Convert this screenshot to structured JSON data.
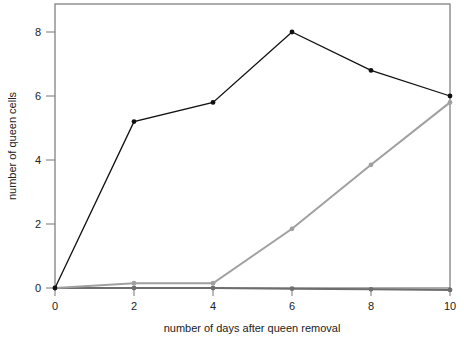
{
  "chart_data": {
    "type": "line",
    "title": "",
    "xlabel": "number  of days after queen removal",
    "ylabel": "number of queen cells",
    "x": [
      0,
      2,
      4,
      6,
      8,
      10
    ],
    "xticks": [
      "0",
      "2",
      "4",
      "6",
      "8",
      "10"
    ],
    "yticks": [
      "0",
      "2",
      "4",
      "6",
      "8"
    ],
    "xlim": [
      0,
      10
    ],
    "ylim": [
      0,
      8.8
    ],
    "grid": false,
    "legend": null,
    "series": [
      {
        "name": "series-black",
        "color": "#111111",
        "values": [
          0,
          5.2,
          5.8,
          8.0,
          6.8,
          6.0
        ]
      },
      {
        "name": "series-light-gray",
        "color": "#a0a0a0",
        "values": [
          0,
          0.15,
          0.15,
          1.85,
          3.85,
          5.8
        ]
      },
      {
        "name": "series-dark-gray",
        "color": "#6e6e6e",
        "values": [
          0,
          0,
          0,
          -0.02,
          -0.04,
          -0.06
        ]
      }
    ]
  }
}
